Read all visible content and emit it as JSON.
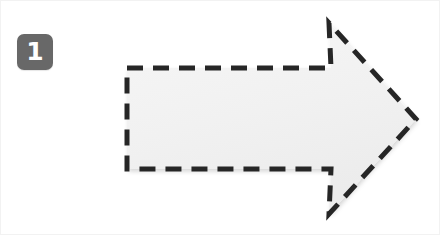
{
  "canvas": {
    "width": 440,
    "height": 235,
    "background_color": "#ffffff",
    "border_color": "#f2f2f2"
  },
  "badge": {
    "label": "1",
    "icon_name": "step-number-badge",
    "background_color": "#686868",
    "text_color": "#ffffff",
    "x": 16,
    "y": 33,
    "size": 36,
    "corner_radius": 7
  },
  "annotation": {
    "shape_name": "dashed-right-arrow",
    "direction": "right",
    "fill_color": "#f1f1f1",
    "fill_color_light": "#f6f6f6",
    "stroke_color": "#262626",
    "stroke_width": 5,
    "dash_length": 16,
    "dash_gap": 10,
    "points": "126,67 330,67 328,22 415,118 328,213 330,168 126,168",
    "shadow_color": "rgba(0,0,0,0.13)"
  }
}
